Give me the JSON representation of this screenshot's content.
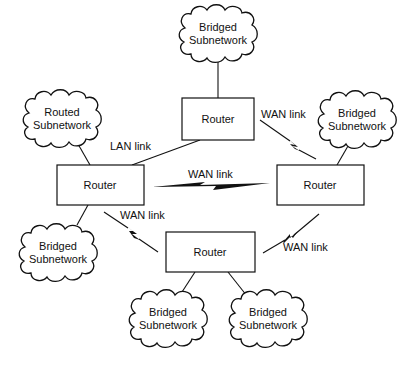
{
  "diagram": {
    "routers": [
      {
        "id": "top",
        "label": "Router"
      },
      {
        "id": "left",
        "label": "Router"
      },
      {
        "id": "right",
        "label": "Router"
      },
      {
        "id": "bottom",
        "label": "Router"
      }
    ],
    "subnetworks": [
      {
        "id": "top",
        "line1": "Bridged",
        "line2": "Subnetwork"
      },
      {
        "id": "routed-left",
        "line1": "Routed",
        "line2": "Subnetwork"
      },
      {
        "id": "right",
        "line1": "Bridged",
        "line2": "Subnetwork"
      },
      {
        "id": "left-bottom",
        "line1": "Bridged",
        "line2": "Subnetwork"
      },
      {
        "id": "bottom-left",
        "line1": "Bridged",
        "line2": "Subnetwork"
      },
      {
        "id": "bottom-right",
        "line1": "Bridged",
        "line2": "Subnetwork"
      }
    ],
    "links": [
      {
        "id": "top-left",
        "label": "LAN link"
      },
      {
        "id": "top-right",
        "label": "WAN link"
      },
      {
        "id": "left-right",
        "label": "WAN link"
      },
      {
        "id": "left-bottom",
        "label": "WAN link"
      },
      {
        "id": "bottom-right",
        "label": "WAN link"
      }
    ]
  }
}
